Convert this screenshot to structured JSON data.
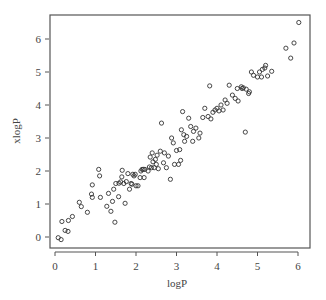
{
  "chart_data": {
    "type": "scatter",
    "title": "",
    "xlabel": "logP",
    "ylabel": "xlogP",
    "xlim": [
      -0.15,
      6.25
    ],
    "ylim": [
      -0.35,
      6.7
    ],
    "xticks": [
      0,
      1,
      2,
      3,
      4,
      5,
      6
    ],
    "yticks": [
      0,
      1,
      2,
      3,
      4,
      5,
      6
    ],
    "grid": false,
    "legend": null,
    "marker": "open-circle",
    "series": [
      {
        "name": "compounds",
        "points": [
          [
            0.08,
            -0.02
          ],
          [
            0.15,
            -0.08
          ],
          [
            0.17,
            0.47
          ],
          [
            0.25,
            0.2
          ],
          [
            0.32,
            0.17
          ],
          [
            0.33,
            0.5
          ],
          [
            0.43,
            0.62
          ],
          [
            0.6,
            1.05
          ],
          [
            0.65,
            0.92
          ],
          [
            0.8,
            0.75
          ],
          [
            0.9,
            1.3
          ],
          [
            0.92,
            1.2
          ],
          [
            0.92,
            1.58
          ],
          [
            1.08,
            2.05
          ],
          [
            1.1,
            1.85
          ],
          [
            1.12,
            1.2
          ],
          [
            1.28,
            0.93
          ],
          [
            1.32,
            1.32
          ],
          [
            1.38,
            0.78
          ],
          [
            1.42,
            1.08
          ],
          [
            1.45,
            1.45
          ],
          [
            1.48,
            0.45
          ],
          [
            1.5,
            1.62
          ],
          [
            1.57,
            1.22
          ],
          [
            1.58,
            1.63
          ],
          [
            1.62,
            1.67
          ],
          [
            1.65,
            1.82
          ],
          [
            1.66,
            2.02
          ],
          [
            1.7,
            1.62
          ],
          [
            1.73,
            1.02
          ],
          [
            1.76,
            1.68
          ],
          [
            1.8,
            1.92
          ],
          [
            1.84,
            1.45
          ],
          [
            1.88,
            1.62
          ],
          [
            1.9,
            1.6
          ],
          [
            1.92,
            1.9
          ],
          [
            1.95,
            1.85
          ],
          [
            1.98,
            1.9
          ],
          [
            2.0,
            1.55
          ],
          [
            2.05,
            1.55
          ],
          [
            2.1,
            1.8
          ],
          [
            2.12,
            2.0
          ],
          [
            2.15,
            2.05
          ],
          [
            2.18,
            2.05
          ],
          [
            2.2,
            1.8
          ],
          [
            2.22,
            2.05
          ],
          [
            2.3,
            2.0
          ],
          [
            2.33,
            2.12
          ],
          [
            2.35,
            2.42
          ],
          [
            2.38,
            2.1
          ],
          [
            2.4,
            2.55
          ],
          [
            2.42,
            2.28
          ],
          [
            2.45,
            2.1
          ],
          [
            2.48,
            2.35
          ],
          [
            2.5,
            2.2
          ],
          [
            2.52,
            2.48
          ],
          [
            2.55,
            2.07
          ],
          [
            2.6,
            2.6
          ],
          [
            2.63,
            3.45
          ],
          [
            2.68,
            2.25
          ],
          [
            2.7,
            2.55
          ],
          [
            2.75,
            2.1
          ],
          [
            2.8,
            2.45
          ],
          [
            2.85,
            1.75
          ],
          [
            2.88,
            3.0
          ],
          [
            2.92,
            2.85
          ],
          [
            2.95,
            2.2
          ],
          [
            3.0,
            2.62
          ],
          [
            3.05,
            2.2
          ],
          [
            3.08,
            2.65
          ],
          [
            3.1,
            2.32
          ],
          [
            3.12,
            3.25
          ],
          [
            3.15,
            3.8
          ],
          [
            3.18,
            3.1
          ],
          [
            3.2,
            2.9
          ],
          [
            3.25,
            3.05
          ],
          [
            3.3,
            3.6
          ],
          [
            3.35,
            3.35
          ],
          [
            3.4,
            2.9
          ],
          [
            3.42,
            3.2
          ],
          [
            3.48,
            3.3
          ],
          [
            3.55,
            3.0
          ],
          [
            3.58,
            3.15
          ],
          [
            3.65,
            3.62
          ],
          [
            3.7,
            3.9
          ],
          [
            3.78,
            3.65
          ],
          [
            3.82,
            4.58
          ],
          [
            3.85,
            3.58
          ],
          [
            3.9,
            3.78
          ],
          [
            3.95,
            3.85
          ],
          [
            4.0,
            3.9
          ],
          [
            4.05,
            3.82
          ],
          [
            4.1,
            4.0
          ],
          [
            4.15,
            3.85
          ],
          [
            4.2,
            4.15
          ],
          [
            4.25,
            4.05
          ],
          [
            4.3,
            4.6
          ],
          [
            4.38,
            4.3
          ],
          [
            4.45,
            4.2
          ],
          [
            4.5,
            4.5
          ],
          [
            4.52,
            4.12
          ],
          [
            4.6,
            4.55
          ],
          [
            4.62,
            4.5
          ],
          [
            4.65,
            4.52
          ],
          [
            4.7,
            3.18
          ],
          [
            4.72,
            4.48
          ],
          [
            4.78,
            4.35
          ],
          [
            4.8,
            4.4
          ],
          [
            4.85,
            5.0
          ],
          [
            4.9,
            4.9
          ],
          [
            5.0,
            4.85
          ],
          [
            5.05,
            5.0
          ],
          [
            5.1,
            4.85
          ],
          [
            5.12,
            5.08
          ],
          [
            5.18,
            5.12
          ],
          [
            5.2,
            5.2
          ],
          [
            5.25,
            4.88
          ],
          [
            5.35,
            5.02
          ],
          [
            5.7,
            5.72
          ],
          [
            5.82,
            5.42
          ],
          [
            5.9,
            5.88
          ],
          [
            6.02,
            6.5
          ]
        ]
      }
    ],
    "plot_area_px": {
      "left": 50,
      "top": 15,
      "right": 310,
      "bottom": 248
    }
  }
}
